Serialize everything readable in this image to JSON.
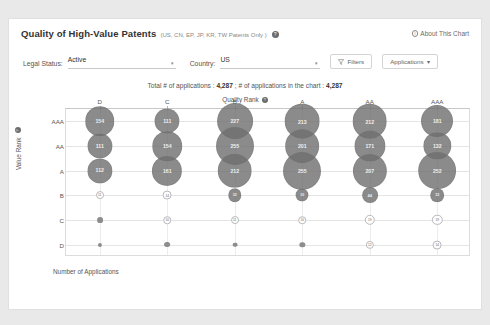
{
  "header": {
    "title": "Quality of High-Value Patents",
    "title_sub": "(US, CN, EP, JP, KR, TW Patents Only )",
    "help_glyph": "?",
    "about_label": "About This Chart",
    "about_glyph": "i"
  },
  "filters": {
    "legal_status_label": "Legal Status:",
    "legal_status_value": "Active",
    "country_label": "Country:",
    "country_value": "US",
    "caret": "▾",
    "filters_button": "Filters",
    "applications_button": "Applications",
    "applications_caret": "▾"
  },
  "subtitle": {
    "prefix": "Total # of applications :",
    "total": "4,287",
    "middle": "; # of applications in the chart :",
    "in_chart": "4,287"
  },
  "footer": {
    "x_bottom_label": "Number of Applications"
  },
  "chart_data": {
    "type": "bubble",
    "title": "Quality of High-Value Patents",
    "xlabel": "Quality Rank",
    "ylabel": "Value Rank",
    "x_categories": [
      "D",
      "C",
      "B",
      "A",
      "AA",
      "AAA"
    ],
    "y_categories": [
      "AAA",
      "AA",
      "A",
      "B",
      "C",
      "D"
    ],
    "grid": true,
    "legend": "none",
    "value_unit": "Number of Applications",
    "matrix": [
      {
        "value_rank": "AAA",
        "values": [
          154,
          111,
          227,
          213,
          212,
          181
        ]
      },
      {
        "value_rank": "AA",
        "values": [
          111,
          154,
          255,
          201,
          171,
          132
        ]
      },
      {
        "value_rank": "A",
        "values": [
          112,
          161,
          212,
          255,
          207,
          252
        ]
      },
      {
        "value_rank": "B",
        "values": [
          11,
          14,
          32,
          30,
          44,
          33
        ]
      },
      {
        "value_rank": "C",
        "values": [
          6,
          10,
          11,
          10,
          19,
          19
        ]
      },
      {
        "value_rank": "D",
        "values": [
          3,
          6,
          4,
          5,
          12,
          14
        ]
      }
    ]
  }
}
